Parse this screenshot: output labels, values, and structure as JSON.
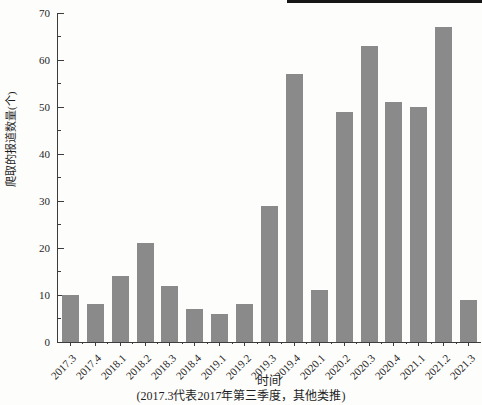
{
  "page": {
    "background_color": "#fdfdfb",
    "scan_rule_color": "#161616"
  },
  "chart_data": {
    "type": "bar",
    "title": "",
    "categories": [
      "2017.3",
      "2017.4",
      "2018.1",
      "2018.2",
      "2018.3",
      "2018.4",
      "2019.1",
      "2019.2",
      "2019.3",
      "2019.4",
      "2020.1",
      "2020.2",
      "2020.3",
      "2020.4",
      "2021.1",
      "2021.2",
      "2021.3"
    ],
    "values": [
      10,
      8,
      14,
      21,
      12,
      7,
      6,
      8,
      29,
      57,
      11,
      49,
      63,
      51,
      50,
      67,
      9
    ],
    "xlabel": "时间",
    "ylabel": "爬取的报道数量(个)",
    "caption": "(2017.3代表2017年第三季度，其他类推)",
    "ylim": [
      0,
      70
    ],
    "yticks": [
      0,
      10,
      20,
      30,
      40,
      50,
      60,
      70
    ],
    "ytick_minor_step": 5,
    "grid": false,
    "legend": "none",
    "bar_color": "#8a8a8a",
    "axis_color": "#3c3c3c",
    "text_color": "#1f1f1f"
  }
}
